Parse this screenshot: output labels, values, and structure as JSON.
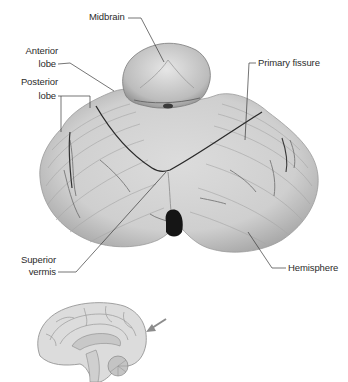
{
  "figure": {
    "labels": {
      "midbrain": "Midbrain",
      "anterior_lobe_line1": "Anterior",
      "anterior_lobe_line2": "lobe",
      "posterior_lobe_line1": "Posterior",
      "posterior_lobe_line2": "lobe",
      "primary_fissure": "Primary fissure",
      "superior_vermis_line1": "Superior",
      "superior_vermis_line2": "vermis",
      "hemisphere": "Hemisphere"
    },
    "inset": {
      "description": "Midsagittal brain orientation sketch",
      "arrow": "arrow-indicating-view-direction"
    },
    "colors": {
      "leader_line": "#3a3a3a",
      "label_text": "#2b2b2b",
      "tissue_light": "#e4e4e4",
      "tissue_mid": "#bdbdbd",
      "tissue_dark": "#6e6e6e",
      "fissure": "#2a2a2a",
      "inset_fill": "#d9d9d9",
      "inset_stroke": "#8a8a8a",
      "arrow": "#8c8c8c"
    }
  }
}
